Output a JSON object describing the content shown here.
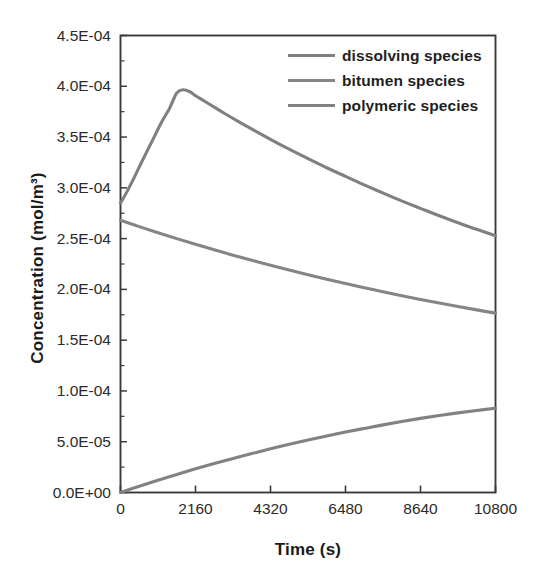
{
  "chart_data": {
    "type": "line",
    "title": "",
    "xlabel": "Time (s)",
    "ylabel": "Concentration (mol/m³)",
    "xlim": [
      0,
      10800
    ],
    "ylim": [
      0,
      0.00045
    ],
    "xticks": [
      0,
      2160,
      4320,
      6480,
      8640,
      10800
    ],
    "xticklabels": [
      "0",
      "2160",
      "4320",
      "6480",
      "8640",
      "10800"
    ],
    "yticks": [
      0,
      5e-05,
      0.0001,
      0.00015,
      0.0002,
      0.00025,
      0.0003,
      0.00035,
      0.0004,
      0.00045
    ],
    "yticklabels": [
      "0.0E+00",
      "5.0E-05",
      "1.0E-04",
      "1.5E-04",
      "2.0E-04",
      "2.5E-04",
      "3.0E-04",
      "3.5E-04",
      "4.0E-04",
      "4.5E-04"
    ],
    "grid": false,
    "legend_position": "upper right",
    "minor_ticks_y": true,
    "series": [
      {
        "name": "dissolving species",
        "color": "#808080",
        "x": [
          0,
          200,
          400,
          600,
          800,
          1000,
          1200,
          1400,
          1500,
          1620,
          1800,
          2000,
          2160,
          2400,
          2700,
          3000,
          3400,
          3800,
          4320,
          4800,
          5400,
          6000,
          6480,
          7000,
          7600,
          8200,
          8640,
          9200,
          9800,
          10400,
          10800
        ],
        "y": [
          2.85e-05,
          2.97e-05,
          3.106e-05,
          3.247e-05,
          3.385e-05,
          3.522e-05,
          3.658e-05,
          3.774e-05,
          3.85e-05,
          3.934e-05,
          3.965e-05,
          3.946e-05,
          3.907e-05,
          3.857e-05,
          3.795e-05,
          3.732e-05,
          3.652e-05,
          3.575e-05,
          3.478e-05,
          3.39e-05,
          3.287e-05,
          3.188e-05,
          3.113e-05,
          3.032e-05,
          2.943e-05,
          2.857e-05,
          2.798e-05,
          2.723e-05,
          2.647e-05,
          2.575e-05,
          2.528e-05
        ],
        "y_scale_note": "values expressed in mol/m^3; e.g. 0.0000285 = 2.85E-05",
        "y_actual": [
          0.000285,
          0.000297,
          0.0003106,
          0.0003247,
          0.0003385,
          0.0003522,
          0.0003658,
          0.0003774,
          0.000385,
          0.0003934,
          0.0003965,
          0.0003946,
          0.0003907,
          0.0003857,
          0.0003795,
          0.0003732,
          0.0003652,
          0.0003575,
          0.0003478,
          0.000339,
          0.0003287,
          0.0003188,
          0.0003113,
          0.0003032,
          0.0002943,
          0.0002857,
          0.0002798,
          0.0002723,
          0.0002647,
          0.0002575,
          0.0002528
        ]
      },
      {
        "name": "bitumen species",
        "color": "#858585",
        "x": [
          0,
          540,
          1080,
          1620,
          2160,
          2700,
          3240,
          3780,
          4320,
          4860,
          5400,
          5940,
          6480,
          7020,
          7560,
          8100,
          8640,
          9180,
          9720,
          10260,
          10800
        ],
        "y_actual": [
          0.000268,
          0.0002618,
          0.0002558,
          0.00025,
          0.0002444,
          0.000239,
          0.0002337,
          0.0002286,
          0.0002237,
          0.000219,
          0.0002144,
          0.00021,
          0.0002057,
          0.0002016,
          0.0001976,
          0.0001938,
          0.0001901,
          0.0001865,
          0.0001831,
          0.0001798,
          0.0001766
        ]
      },
      {
        "name": "polymeric species",
        "color": "#828282",
        "x": [
          0,
          540,
          1080,
          1620,
          2160,
          2700,
          3240,
          3780,
          4320,
          4860,
          5400,
          5940,
          6480,
          7020,
          7560,
          8100,
          8640,
          9180,
          9720,
          10260,
          10800
        ],
        "y_actual": [
          0.0,
          6.2e-06,
          1.21e-05,
          1.78e-05,
          2.33e-05,
          2.85e-05,
          3.35e-05,
          3.83e-05,
          4.3e-05,
          4.74e-05,
          5.16e-05,
          5.56e-05,
          5.95e-05,
          6.31e-05,
          6.66e-05,
          6.99e-05,
          7.3e-05,
          7.58e-05,
          7.84e-05,
          8.08e-05,
          8.29e-05
        ]
      }
    ]
  },
  "legend": {
    "items": [
      {
        "label": "dissolving species"
      },
      {
        "label": "bitumen species"
      },
      {
        "label": "polymeric species"
      }
    ]
  },
  "style": {
    "axis_color": "#3a3a3a",
    "tick_label_color": "#2b2b2b",
    "line_color": "#808080",
    "background": "#ffffff"
  }
}
